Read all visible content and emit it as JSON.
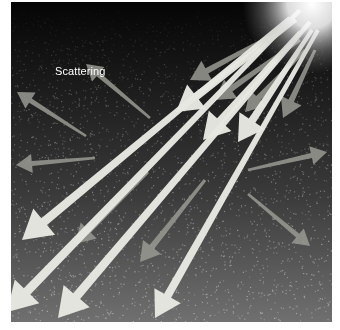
{
  "diagram": {
    "title": "Scattering",
    "label": "Scattering",
    "label_position": {
      "x": 44,
      "y": 63
    },
    "colors": {
      "background_top": "#050505",
      "background_mid": "#2a2a2a",
      "background_bottom": "#6e6e6e",
      "sun": "#ffffff",
      "arrow_bright": "#e8e8e2",
      "arrow_dim": "#9a9a94",
      "speckle": "#bdbdbd"
    },
    "sun": {
      "x": 312,
      "y": 2,
      "radius": 70
    },
    "incoming_rays": [
      {
        "x1": 300,
        "y1": 10,
        "x2": 7,
        "y2": 312,
        "width": 9,
        "tone": "bright"
      },
      {
        "x1": 310,
        "y1": 22,
        "x2": 58,
        "y2": 318,
        "width": 9,
        "tone": "bright"
      },
      {
        "x1": 318,
        "y1": 30,
        "x2": 155,
        "y2": 318,
        "width": 8,
        "tone": "bright"
      },
      {
        "x1": 290,
        "y1": 18,
        "x2": 22,
        "y2": 240,
        "width": 9,
        "tone": "bright"
      },
      {
        "x1": 296,
        "y1": 20,
        "x2": 176,
        "y2": 112,
        "width": 8,
        "tone": "bright"
      },
      {
        "x1": 300,
        "y1": 32,
        "x2": 203,
        "y2": 140,
        "width": 8,
        "tone": "bright"
      },
      {
        "x1": 312,
        "y1": 30,
        "x2": 238,
        "y2": 142,
        "width": 8,
        "tone": "bright"
      },
      {
        "x1": 282,
        "y1": 30,
        "x2": 190,
        "y2": 80,
        "width": 6,
        "tone": "dim"
      },
      {
        "x1": 300,
        "y1": 40,
        "x2": 215,
        "y2": 100,
        "width": 6,
        "tone": "dim"
      },
      {
        "x1": 305,
        "y1": 50,
        "x2": 245,
        "y2": 112,
        "width": 6,
        "tone": "dim"
      },
      {
        "x1": 315,
        "y1": 50,
        "x2": 283,
        "y2": 118,
        "width": 6,
        "tone": "dim"
      },
      {
        "x1": 205,
        "y1": 180,
        "x2": 140,
        "y2": 262,
        "width": 6,
        "tone": "dim"
      },
      {
        "x1": 148,
        "y1": 172,
        "x2": 75,
        "y2": 244,
        "width": 6,
        "tone": "dim"
      }
    ],
    "scattered_rays": [
      {
        "x1": 150,
        "y1": 118,
        "x2": 86,
        "y2": 64,
        "width": 5,
        "tone": "dim"
      },
      {
        "x1": 86,
        "y1": 136,
        "x2": 17,
        "y2": 92,
        "width": 5,
        "tone": "dim"
      },
      {
        "x1": 95,
        "y1": 158,
        "x2": 16,
        "y2": 165,
        "width": 5,
        "tone": "dim"
      },
      {
        "x1": 248,
        "y1": 170,
        "x2": 327,
        "y2": 152,
        "width": 5,
        "tone": "dim"
      },
      {
        "x1": 248,
        "y1": 194,
        "x2": 310,
        "y2": 246,
        "width": 5,
        "tone": "dim"
      }
    ]
  }
}
